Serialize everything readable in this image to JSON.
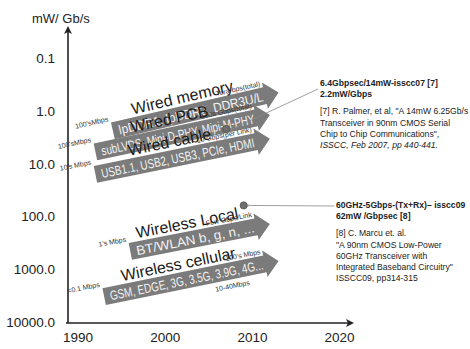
{
  "chart_data": {
    "type": "diagram-arrows",
    "title": "",
    "ylabel": "mW/ Gb/s",
    "xlabel": "",
    "y_scale": "log (inverted)",
    "y_ticks": [
      "0.1",
      "1.0",
      "10.0",
      "100.0",
      "1000.0",
      "10000.0"
    ],
    "y_tick_values": [
      0.1,
      1,
      10,
      100,
      1000,
      10000
    ],
    "x_ticks": [
      "1990",
      "2000",
      "2010",
      "2020"
    ],
    "x_tick_values": [
      1990,
      2000,
      2010,
      2020
    ],
    "xlim": [
      1989,
      2023
    ],
    "ylim": [
      0.03,
      10000
    ],
    "bands": [
      {
        "name": "Wired memory",
        "label": "lpDDR1, lpDDR2, DDR3U/L",
        "start_rate": "100'sMbps",
        "end_rate": "Tera-bps(total)",
        "start": {
          "year": 1994,
          "mw_per_gbps": 2.4
        },
        "end": {
          "year": 2013,
          "mw_per_gbps": 0.45
        }
      },
      {
        "name": "Wired PCB",
        "label": "subLVDS, Mipi-D-PHY, Mipi-M-PHY",
        "start_rate": "100'sMbps",
        "end_rate": "100s Gbps(total)",
        "start": {
          "year": 1992,
          "mw_per_gbps": 6
        },
        "end": {
          "year": 2012,
          "mw_per_gbps": 1.2
        }
      },
      {
        "name": "Wired cable",
        "label": "USB1.1, USB2, USB3, PCIe, HDMI",
        "start_rate": "10's Mbps",
        "end_rate": "10 Gbps(per Link)",
        "start": {
          "year": 1992,
          "mw_per_gbps": 16
        },
        "end": {
          "year": 2012,
          "mw_per_gbps": 3.4
        }
      },
      {
        "name": "Wireless Local",
        "label": "BT/WLAN b, g, n, ...",
        "start_rate": "1's Mbps",
        "end_rate": "Few Gbps/Link",
        "start": {
          "year": 1996,
          "mw_per_gbps": 460
        },
        "end": {
          "year": 2012,
          "mw_per_gbps": 140
        }
      },
      {
        "name": "Wireless cellular",
        "label": "GSM, EDGE, 3G, 3.5G, 3.9G, 4G...",
        "start_rate": "<0.1 Mbps",
        "end_rate": "100's Mbps",
        "mid_rate": "10-40Mbps",
        "start": {
          "year": 1993,
          "mw_per_gbps": 3300
        },
        "end": {
          "year": 2013,
          "mw_per_gbps": 700
        }
      }
    ],
    "points": [
      {
        "label": "6.4Gbpsec/14mW-isscc07 [7] 2.2mW/Gbps",
        "year": 2007,
        "mw_per_gbps": 2.2
      },
      {
        "label": "60GHz-5Gbps-(Tx+Rx)- isscc09 62mW /Gbpsec [8]",
        "year": 2009,
        "mw_per_gbps": 62
      }
    ],
    "annotations": [
      {
        "id": "ref7",
        "headline": [
          "6.4Gbpsec/14mW-isscc07 [7]",
          "2.2mW/Gbps"
        ],
        "citation": [
          "[7] R. Palmer, et al, \"A 14mW 6.25Gb/s",
          "Transceiver in 90nm CMOS Serial",
          "Chip to Chip Communications\",",
          "ISSCC, Feb 2007, pp 440-441."
        ]
      },
      {
        "id": "ref8",
        "headline": [
          "60GHz-5Gbps-(Tx+Rx)– isscc09",
          "62mW /Gbpsec [8]"
        ],
        "citation": [
          "[8] C. Marcu et. al.",
          "\"A 90nm CMOS Low-Power",
          "60GHz Transceiver with",
          "Integrated Baseband Circuitry\"",
          "ISSCC09, pp314-315"
        ]
      }
    ],
    "colors": {
      "band_fill": "#7b7b7b",
      "axis": "#222222",
      "leader": "#888888",
      "point": "#6e6e6e"
    }
  }
}
